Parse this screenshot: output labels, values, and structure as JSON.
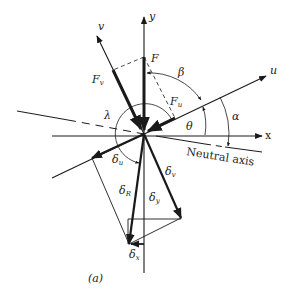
{
  "figure": {
    "caption": "(a)",
    "labels": {
      "x_axis": "x",
      "y_axis": "y",
      "u_axis": "u",
      "v_axis": "v",
      "force": "F",
      "force_v": "F",
      "force_v_sub": "v",
      "force_u": "F",
      "force_u_sub": "u",
      "beta": "β",
      "theta": "θ",
      "alpha": "α",
      "lambda": "λ",
      "neutral_axis": "Neutral axis",
      "delta_u": "δ",
      "delta_u_sub": "u",
      "delta_v": "δ",
      "delta_v_sub": "v",
      "delta_R": "δ",
      "delta_R_sub": "R",
      "delta_y": "δ",
      "delta_y_sub": "y",
      "delta_x": "δ",
      "delta_x_sub": "x"
    },
    "colors": {
      "ink": "#1a1a1a",
      "background": "#ffffff"
    }
  }
}
